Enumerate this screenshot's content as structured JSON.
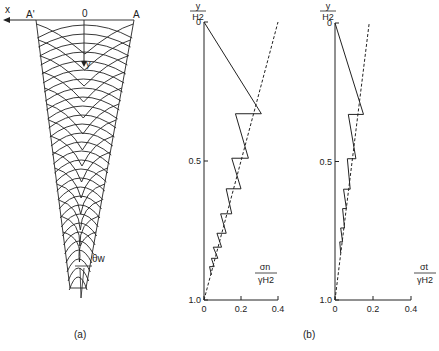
{
  "panel_a": {
    "label": "(a)",
    "x_axis_label": "x",
    "y_axis_label": "y",
    "origin_label": "0",
    "left_corner_label": "A'",
    "right_corner_label": "A",
    "wall_angle_label": "θw"
  },
  "panel_b": {
    "label": "(b)"
  },
  "chart_data": [
    {
      "type": "line",
      "title": "",
      "ylabel_num": "y",
      "ylabel_den": "H2",
      "xlabel_num": "σn",
      "xlabel_den": "γH2",
      "xlim": [
        0,
        0.4
      ],
      "ylim": [
        0,
        1.0
      ],
      "x_ticks": [
        "0",
        "0.2",
        "0.4"
      ],
      "x_tick_values": [
        0,
        0.2,
        0.4
      ],
      "y_ticks": [
        "0",
        "0.5",
        "1.0"
      ],
      "y_tick_values": [
        0,
        0.5,
        1.0
      ],
      "series": [
        {
          "name": "stress-solid",
          "style": "solid",
          "points": [
            [
              0,
              0
            ],
            [
              0.31,
              0.33
            ],
            [
              0.17,
              0.33
            ],
            [
              0.24,
              0.49
            ],
            [
              0.15,
              0.49
            ],
            [
              0.2,
              0.6
            ],
            [
              0.12,
              0.6
            ],
            [
              0.15,
              0.69
            ],
            [
              0.09,
              0.69
            ],
            [
              0.12,
              0.76
            ],
            [
              0.07,
              0.76
            ],
            [
              0.095,
              0.81
            ],
            [
              0.05,
              0.81
            ],
            [
              0.075,
              0.85
            ],
            [
              0.04,
              0.85
            ],
            [
              0.055,
              0.88
            ],
            [
              0.03,
              0.88
            ],
            [
              0.04,
              0.91
            ]
          ]
        },
        {
          "name": "stress-dashed",
          "style": "dashed",
          "points": [
            [
              0,
              1.0
            ],
            [
              0.4,
              0.0
            ]
          ]
        }
      ]
    },
    {
      "type": "line",
      "title": "",
      "ylabel_num": "y",
      "ylabel_den": "H2",
      "xlabel_num": "σt",
      "xlabel_den": "γH2",
      "xlim": [
        0,
        0.4
      ],
      "ylim": [
        0,
        1.0
      ],
      "x_ticks": [
        "0",
        "0.2",
        "0.4"
      ],
      "x_tick_values": [
        0,
        0.2,
        0.4
      ],
      "y_ticks": [
        "0",
        "0.5",
        "1.0"
      ],
      "y_tick_values": [
        0,
        0.5,
        1.0
      ],
      "series": [
        {
          "name": "stress-solid",
          "style": "solid",
          "points": [
            [
              0,
              0
            ],
            [
              0.15,
              0.33
            ],
            [
              0.07,
              0.33
            ],
            [
              0.11,
              0.49
            ],
            [
              0.065,
              0.49
            ],
            [
              0.08,
              0.6
            ],
            [
              0.045,
              0.6
            ],
            [
              0.06,
              0.67
            ],
            [
              0.04,
              0.67
            ],
            [
              0.05,
              0.74
            ],
            [
              0.03,
              0.74
            ],
            [
              0.04,
              0.79
            ],
            [
              0.025,
              0.79
            ],
            [
              0.03,
              0.83
            ]
          ]
        },
        {
          "name": "stress-dashed",
          "style": "dashed",
          "points": [
            [
              0,
              1.0
            ],
            [
              0.18,
              0.0
            ]
          ]
        }
      ]
    }
  ]
}
